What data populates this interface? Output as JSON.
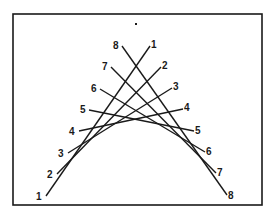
{
  "diagram": {
    "frame": {
      "x": 13,
      "y": 14,
      "width": 249,
      "height": 191,
      "stroke": "#1a1a1a"
    },
    "dot": {
      "x": 136,
      "y": 24
    },
    "line_color": "#1a1a1a",
    "lines": [
      {
        "id": 1,
        "left_label": "1",
        "right_label": "1",
        "x1": 46,
        "y1": 196,
        "x2": 150,
        "y2": 46
      },
      {
        "id": 2,
        "left_label": "2",
        "right_label": "2",
        "x1": 57,
        "y1": 174,
        "x2": 161,
        "y2": 67
      },
      {
        "id": 3,
        "left_label": "3",
        "right_label": "3",
        "x1": 68,
        "y1": 153,
        "x2": 172,
        "y2": 88
      },
      {
        "id": 4,
        "left_label": "4",
        "right_label": "4",
        "x1": 79,
        "y1": 131,
        "x2": 183,
        "y2": 109
      },
      {
        "id": 5,
        "left_label": "5",
        "right_label": "5",
        "x1": 89,
        "y1": 110,
        "x2": 194,
        "y2": 131
      },
      {
        "id": 6,
        "left_label": "6",
        "right_label": "6",
        "x1": 100,
        "y1": 89,
        "x2": 205,
        "y2": 152
      },
      {
        "id": 7,
        "left_label": "7",
        "right_label": "7",
        "x1": 111,
        "y1": 67,
        "x2": 216,
        "y2": 173
      },
      {
        "id": 8,
        "left_label": "8",
        "right_label": "8",
        "x1": 122,
        "y1": 46,
        "x2": 227,
        "y2": 195
      }
    ],
    "left_labels": [
      {
        "text": "1",
        "x": 36,
        "y": 200
      },
      {
        "text": "2",
        "x": 47,
        "y": 178
      },
      {
        "text": "3",
        "x": 58,
        "y": 157
      },
      {
        "text": "4",
        "x": 69,
        "y": 135
      },
      {
        "text": "5",
        "x": 80,
        "y": 113
      },
      {
        "text": "6",
        "x": 91,
        "y": 92
      },
      {
        "text": "7",
        "x": 102,
        "y": 70
      },
      {
        "text": "8",
        "x": 113,
        "y": 49
      }
    ],
    "right_labels": [
      {
        "text": "1",
        "x": 151,
        "y": 48
      },
      {
        "text": "2",
        "x": 162,
        "y": 69
      },
      {
        "text": "3",
        "x": 173,
        "y": 90
      },
      {
        "text": "4",
        "x": 184,
        "y": 111
      },
      {
        "text": "5",
        "x": 195,
        "y": 134
      },
      {
        "text": "6",
        "x": 206,
        "y": 155
      },
      {
        "text": "7",
        "x": 217,
        "y": 176
      },
      {
        "text": "8",
        "x": 228,
        "y": 199
      }
    ]
  }
}
